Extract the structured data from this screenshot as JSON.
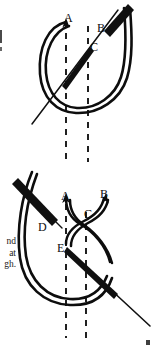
{
  "page": {
    "background_color": "#ffffff",
    "ink_color": "#111111",
    "width": 154,
    "height": 349
  },
  "margin_text": {
    "lines": [
      "nd",
      "at",
      "gh."
    ],
    "note": "cut-off body text at left page margin"
  },
  "figures": [
    {
      "id": "figure-top",
      "name": "stitch-diagram-top",
      "caption": "",
      "labels": [
        {
          "text": "A",
          "x": 68,
          "y": 18
        },
        {
          "text": "B",
          "x": 100,
          "y": 29
        },
        {
          "text": "C",
          "x": 93,
          "y": 48
        }
      ],
      "elements": {
        "thread_loop": "u-shaped double-line thread loop",
        "needle": "diagonal needle crossing loop from lower-left to upper-right",
        "guides": "two vertical dashed fabric guide lines"
      }
    },
    {
      "id": "figure-bottom",
      "name": "stitch-diagram-bottom",
      "caption": "",
      "labels": [
        {
          "text": "A",
          "x": 64,
          "y": 196
        },
        {
          "text": "B",
          "x": 102,
          "y": 194
        },
        {
          "text": "C",
          "x": 87,
          "y": 213
        },
        {
          "text": "D",
          "x": 41,
          "y": 224
        },
        {
          "text": "E",
          "x": 60,
          "y": 248
        }
      ],
      "elements": {
        "thread_loop": "large left-hand double-line thread loop",
        "crossed_thread": "threads crossing at point C with arrow tips at A and B",
        "needle_d": "needle angled down-right labelled D",
        "needle_e": "needle angled down-right from point E",
        "guides": "two vertical dashed fabric guide lines"
      }
    }
  ],
  "edge_marks": {
    "top_left": "ink speck at left page edge",
    "bottom_right": "ink speck at bottom right page edge"
  }
}
